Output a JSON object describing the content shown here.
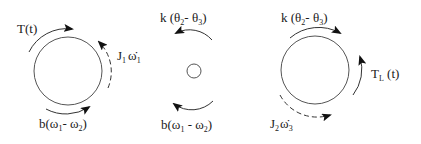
{
  "diagram": {
    "type": "free-body torque diagram",
    "bodies": [
      {
        "id": "inertia-1",
        "labels": {
          "applied_torque": {
            "main": "T(t)"
          },
          "inertial_torque": {
            "main": "J",
            "sub": "1",
            "var": "ω̇",
            "varsub": "1"
          },
          "damping_torque": {
            "prefix": "b(ω",
            "sub1": "1",
            "mid": "- ω",
            "sub2": "2",
            "suffix": ")"
          }
        }
      },
      {
        "id": "massless-node-2",
        "labels": {
          "spring_torque": {
            "prefix": "k (θ",
            "sub1": "2",
            "mid": "- θ",
            "sub2": "3",
            "suffix": ")"
          },
          "damping_torque": {
            "prefix": "b(ω",
            "sub1": "1",
            "mid": " - ω",
            "sub2": "2",
            "suffix": ")"
          }
        }
      },
      {
        "id": "inertia-2",
        "labels": {
          "spring_torque": {
            "prefix": "k (θ",
            "sub1": "2",
            "mid": "- θ",
            "sub2": "3",
            "suffix": ")"
          },
          "load_torque": {
            "main": "T",
            "sub": "L",
            "suffix": " (t)"
          },
          "inertial_torque": {
            "main": "J",
            "sub": "2",
            "var": "ω̇",
            "varsub": "3"
          }
        }
      }
    ],
    "colors": {
      "stroke": "#555555",
      "arrow": "#111111",
      "text": "#1a1a1a"
    }
  }
}
